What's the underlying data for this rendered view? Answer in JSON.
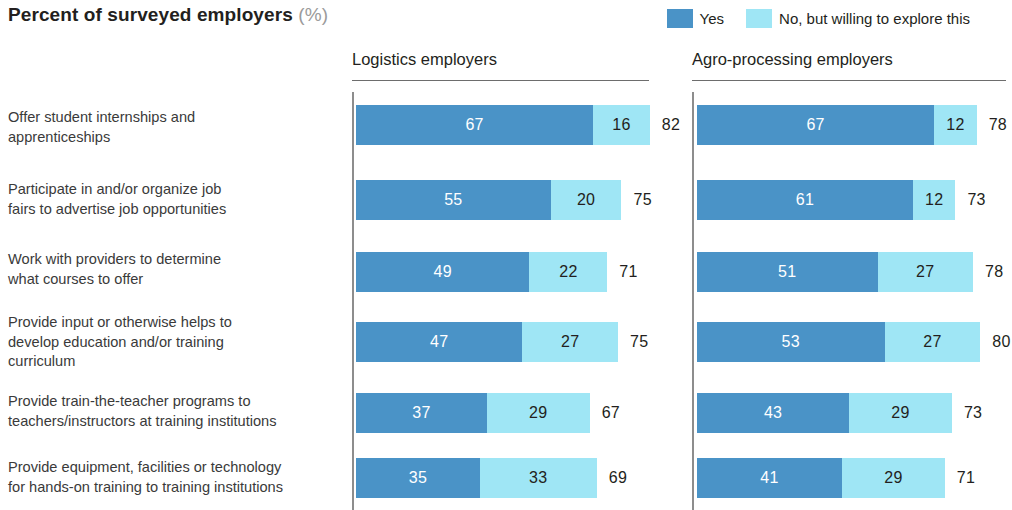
{
  "header": {
    "title": "Percent of surveyed employers",
    "unit": "(%)"
  },
  "legend": {
    "items": [
      {
        "label": "Yes",
        "color": "#4a93c7",
        "icon": "square-swatch-icon"
      },
      {
        "label": "No, but willing to explore this",
        "color": "#9fe6f5",
        "icon": "square-swatch-icon"
      }
    ]
  },
  "panels": [
    {
      "key": "logistics",
      "title": "Logistics employers"
    },
    {
      "key": "agro",
      "title": "Agro-processing employers"
    }
  ],
  "chart_data": {
    "type": "bar",
    "title": "Percent of surveyed employers (%)",
    "xlabel": "",
    "ylabel": "",
    "orientation": "horizontal",
    "stacked": true,
    "grid": false,
    "legend_position": "top-right",
    "xlim": [
      0,
      100
    ],
    "series": [
      {
        "name": "Yes",
        "color": "#4a93c7"
      },
      {
        "name": "No, but willing to explore this",
        "color": "#9fe6f5"
      }
    ],
    "categories": [
      "Offer student internships and apprenticeships",
      "Participate in and/or organize job fairs to advertise job opportunities",
      "Work with providers to determine what courses to offer",
      "Provide input or otherwise helps to develop education and/or training curriculum",
      "Provide train-the-teacher programs to teachers/instructors at training institutions",
      "Provide equipment, facilities or technology for hands-on training to training institutions"
    ],
    "panels": [
      {
        "name": "Logistics employers",
        "rows": [
          {
            "yes": 67,
            "no": 16,
            "total": 82
          },
          {
            "yes": 55,
            "no": 20,
            "total": 75
          },
          {
            "yes": 49,
            "no": 22,
            "total": 71
          },
          {
            "yes": 47,
            "no": 27,
            "total": 75
          },
          {
            "yes": 37,
            "no": 29,
            "total": 67
          },
          {
            "yes": 35,
            "no": 33,
            "total": 69
          }
        ]
      },
      {
        "name": "Agro-processing employers",
        "rows": [
          {
            "yes": 67,
            "no": 12,
            "total": 78
          },
          {
            "yes": 61,
            "no": 12,
            "total": 73
          },
          {
            "yes": 51,
            "no": 27,
            "total": 78
          },
          {
            "yes": 53,
            "no": 27,
            "total": 80
          },
          {
            "yes": 43,
            "no": 29,
            "total": 73
          },
          {
            "yes": 41,
            "no": 29,
            "total": 71
          }
        ]
      }
    ]
  },
  "rows": [
    {
      "label_lines": [
        "Offer student internships and",
        "apprenticeships"
      ]
    },
    {
      "label_lines": [
        "Participate in and/or organize job",
        "fairs to advertise job opportunities"
      ]
    },
    {
      "label_lines": [
        "Work with providers to determine",
        "what courses to offer"
      ]
    },
    {
      "label_lines": [
        "Provide input or otherwise helps to",
        "develop education and/or training",
        "curriculum"
      ]
    },
    {
      "label_lines": [
        "Provide train-the-teacher programs to",
        "teachers/instructors at training institutions"
      ]
    },
    {
      "label_lines": [
        "Provide equipment, facilities or technology",
        "for hands-on training to training institutions"
      ]
    }
  ]
}
